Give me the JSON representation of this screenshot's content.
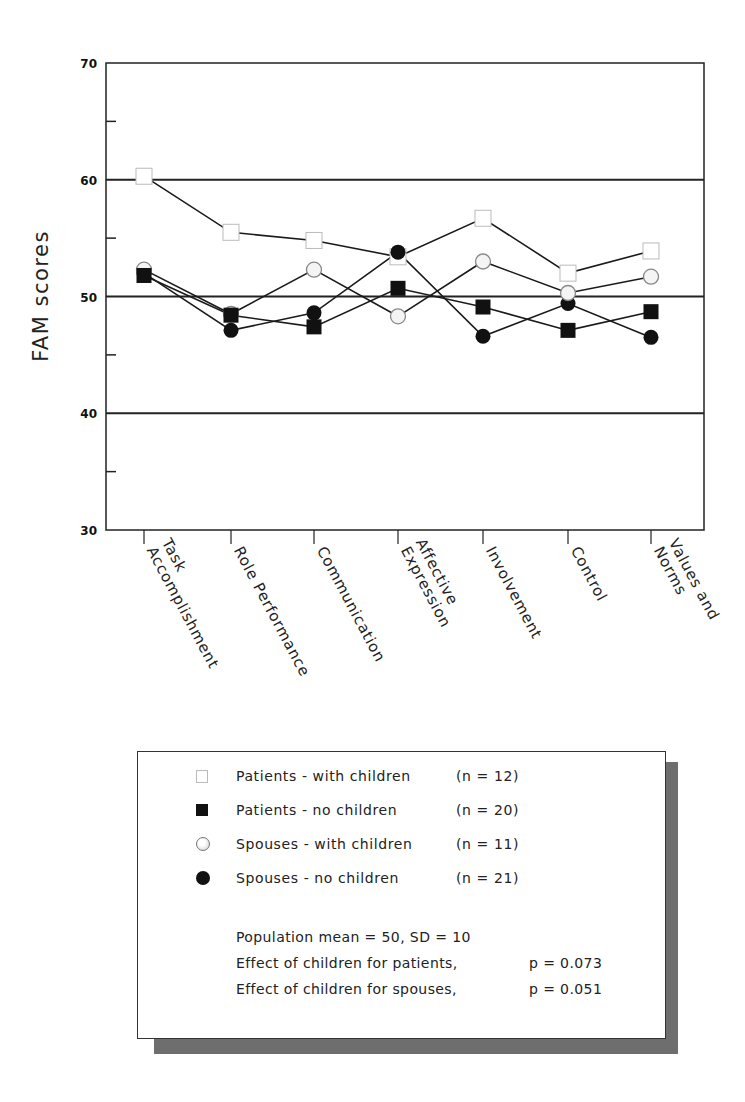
{
  "chart_data": {
    "type": "line",
    "title": "",
    "xlabel": "",
    "ylabel": "FAM scores",
    "ylim": [
      30,
      70
    ],
    "yticks_labeled": [
      30,
      40,
      50,
      60,
      70
    ],
    "yticks_minor": [
      35,
      45,
      55,
      65
    ],
    "reference_lines": [
      40,
      50,
      60
    ],
    "grid": false,
    "legend_position": "below",
    "categories": [
      "Task Accomplishment",
      "Role Performance",
      "Communication",
      "Affective Expression",
      "Involvement",
      "Control",
      "Values and Norms"
    ],
    "category_label_lines": [
      [
        "Task",
        "Accomplishment"
      ],
      [
        "Role Performance"
      ],
      [
        "Communication"
      ],
      [
        "Affective",
        "Expression"
      ],
      [
        "Involvement"
      ],
      [
        "Control"
      ],
      [
        "Values and",
        "Norms"
      ]
    ],
    "series": [
      {
        "name": "Patients - with children",
        "n": "(n = 12)",
        "marker": "open-square",
        "values": [
          60.3,
          55.5,
          54.8,
          53.4,
          56.7,
          52.0,
          53.9
        ]
      },
      {
        "name": "Patients - no children",
        "n": "(n = 20)",
        "marker": "filled-square",
        "values": [
          51.8,
          48.4,
          47.4,
          50.7,
          49.1,
          47.1,
          48.7
        ]
      },
      {
        "name": "Spouses - with children",
        "n": "(n = 11)",
        "marker": "open-circle",
        "values": [
          52.3,
          48.5,
          52.3,
          48.3,
          53.0,
          50.3,
          51.7
        ]
      },
      {
        "name": "Spouses - no children",
        "n": "(n = 21)",
        "marker": "filled-circle",
        "values": [
          52.0,
          47.1,
          48.6,
          53.8,
          46.6,
          49.4,
          46.5
        ]
      }
    ]
  },
  "legend": {
    "items": [
      {
        "label": "Patients - with children",
        "n": "(n = 12)"
      },
      {
        "label": "Patients - no children",
        "n": "(n = 20)"
      },
      {
        "label": "Spouses - with children",
        "n": "(n = 11)"
      },
      {
        "label": "Spouses - no children",
        "n": "(n = 21)"
      }
    ],
    "notes": {
      "population": "Population mean  = 50, SD = 10",
      "patients_effect": "Effect of children for patients,",
      "patients_p": "p = 0.073",
      "spouses_effect": "Effect of children for spouses,",
      "spouses_p": "p = 0.051"
    }
  },
  "colors": {
    "axis": "#222222",
    "line": "#1a1a1a",
    "filled": "#111111",
    "open_fill": "#ffffff",
    "shadow": "#6e6e6e"
  }
}
